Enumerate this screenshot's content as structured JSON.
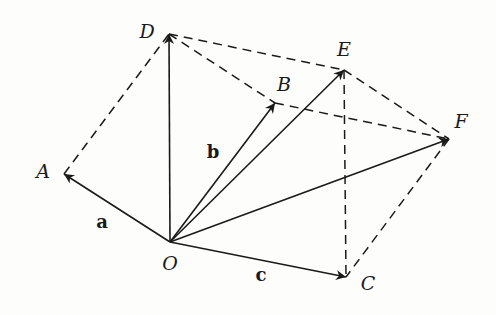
{
  "diagram": {
    "type": "vector-parallelogram-construction",
    "origin": {
      "label": "O",
      "x": 170,
      "y": 242,
      "label_x": 170,
      "label_y": 270
    },
    "points": [
      {
        "id": "A",
        "label": "A",
        "x": 64,
        "y": 174,
        "label_x": 43,
        "label_y": 178
      },
      {
        "id": "D",
        "label": "D",
        "x": 169,
        "y": 34,
        "label_x": 147,
        "label_y": 38
      },
      {
        "id": "B",
        "label": "B",
        "x": 275,
        "y": 103,
        "label_x": 284,
        "label_y": 91
      },
      {
        "id": "E",
        "label": "E",
        "x": 344,
        "y": 70,
        "label_x": 344,
        "label_y": 56
      },
      {
        "id": "F",
        "label": "F",
        "x": 449,
        "y": 139,
        "label_x": 461,
        "label_y": 128
      },
      {
        "id": "C",
        "label": "C",
        "x": 346,
        "y": 277,
        "label_x": 368,
        "label_y": 290
      }
    ],
    "vectors": [
      {
        "from": "O",
        "to": "A",
        "label": "a",
        "label_x": 102,
        "label_y": 228
      },
      {
        "from": "O",
        "to": "D",
        "label": ""
      },
      {
        "from": "O",
        "to": "B",
        "label": "b",
        "label_x": 213,
        "label_y": 158
      },
      {
        "from": "O",
        "to": "E",
        "label": ""
      },
      {
        "from": "O",
        "to": "F",
        "label": ""
      },
      {
        "from": "O",
        "to": "C",
        "label": "c",
        "label_x": 261,
        "label_y": 281
      }
    ],
    "dashed_segments": [
      [
        "A",
        "D"
      ],
      [
        "D",
        "E"
      ],
      [
        "D",
        "B"
      ],
      [
        "B",
        "F"
      ],
      [
        "E",
        "F"
      ],
      [
        "E",
        "C"
      ],
      [
        "F",
        "C"
      ]
    ],
    "labels": {
      "O": "O",
      "A": "A",
      "B": "B",
      "C": "C",
      "D": "D",
      "E": "E",
      "F": "F",
      "a": "a",
      "b": "b",
      "c": "c"
    }
  }
}
